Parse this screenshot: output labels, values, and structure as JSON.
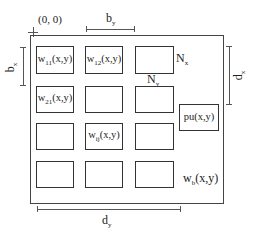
{
  "diagram": {
    "origin_label": "(0, 0)",
    "dimensions": {
      "b_y": {
        "main": "b",
        "sub": "y"
      },
      "b_x": {
        "main": "b",
        "sub": "x"
      },
      "d_x": {
        "main": "d",
        "sub": "x"
      },
      "d_y": {
        "main": "d",
        "sub": "y"
      }
    },
    "grid_labels": {
      "N_x": {
        "main": "N",
        "sub": "x"
      },
      "N_y": {
        "main": "N",
        "sub": "y"
      }
    },
    "boxes": {
      "w11": {
        "main": "w",
        "sub": "11",
        "tail": "(x,y)"
      },
      "w12": {
        "main": "w",
        "sub": "12",
        "tail": "(x,y)"
      },
      "w21": {
        "main": "w",
        "sub": "21",
        "tail": "(x,y)"
      },
      "wij": {
        "main": "w",
        "sub": "ij",
        "tail": "(x,y)"
      },
      "pu": {
        "label": "pu(x,y)"
      }
    },
    "background_label": {
      "main": "w",
      "sub": "b",
      "tail": "(x,y)"
    },
    "colors": {
      "line": "#333333",
      "background": "#ffffff"
    }
  }
}
